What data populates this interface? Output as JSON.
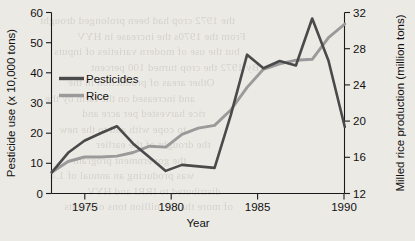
{
  "chart_data": {
    "type": "line",
    "title": "",
    "xlabel": "Year",
    "ylabel": "Pesticide use (x 10,000 tons)",
    "y2label": "Milled rice production (million tons)",
    "xlim": [
      1972,
      1990
    ],
    "ylim": [
      0,
      60
    ],
    "y2lim": [
      12,
      32
    ],
    "xticks": [
      1975,
      1980,
      1985,
      1990
    ],
    "xticklabels": [
      "1975",
      "1980",
      "1985",
      "1990"
    ],
    "yticks": [
      0,
      10,
      20,
      30,
      40,
      50,
      60
    ],
    "yticklabels": [
      "0",
      "10",
      "20",
      "30",
      "40",
      "50",
      "60"
    ],
    "y2ticks": [
      12,
      16,
      20,
      24,
      28,
      32
    ],
    "y2ticklabels": [
      "12",
      "16",
      "20",
      "24",
      "28",
      "32"
    ],
    "grid": false,
    "legend_position": "upper left",
    "series": [
      {
        "name": "Pesticides",
        "axis": "left",
        "unit": "x 10,000 tons",
        "color": "#4a4a4a",
        "x": [
          1972,
          1973,
          1974,
          1975,
          1976,
          1977,
          1978,
          1979,
          1980,
          1981,
          1982,
          1983,
          1984,
          1985,
          1986,
          1987,
          1988,
          1989,
          1990
        ],
        "values": [
          7.0,
          13.5,
          17.5,
          20.0,
          22.3,
          16.5,
          12.0,
          7.5,
          9.5,
          9.0,
          8.5,
          26.0,
          46.0,
          41.5,
          52.0,
          42.5,
          58.0,
          44.0,
          22.0
        ]
      },
      {
        "name": "Rice",
        "axis": "right",
        "unit": "million tons",
        "color": "#9a9a9a",
        "x": [
          1972,
          1973,
          1974,
          1975,
          1976,
          1977,
          1978,
          1979,
          1980,
          1981,
          1982,
          1983,
          1984,
          1985,
          1986,
          1987,
          1988,
          1989,
          1990
        ],
        "values": [
          14.4,
          15.6,
          16.1,
          16.1,
          16.2,
          16.6,
          17.3,
          17.2,
          18.6,
          19.3,
          19.6,
          21.3,
          23.8,
          25.8,
          26.4,
          26.8,
          26.9,
          29.3,
          30.8
        ]
      }
    ],
    "legend": [
      {
        "label": "Pesticides",
        "color": "#4a4a4a"
      },
      {
        "label": "Rice",
        "color": "#9a9a9a"
      }
    ]
  },
  "bleed_lines": [
    "the 1972 crop had been prolonged drought",
    "From the 1970s the increase in HYV",
    "but the use of modern varieties of inputs",
    "By 1972 the crop turned 100 percent",
    "Other areas of production in the",
    "and increased on the farm by the",
    "rice harvested per acre and",
    "to cope with and to the new",
    "the drought of the earlier",
    "the government program",
    "was producing an annual of 1.4",
    "distributed to IRRI and HYV",
    "of more than 4 million tons of inputs"
  ]
}
